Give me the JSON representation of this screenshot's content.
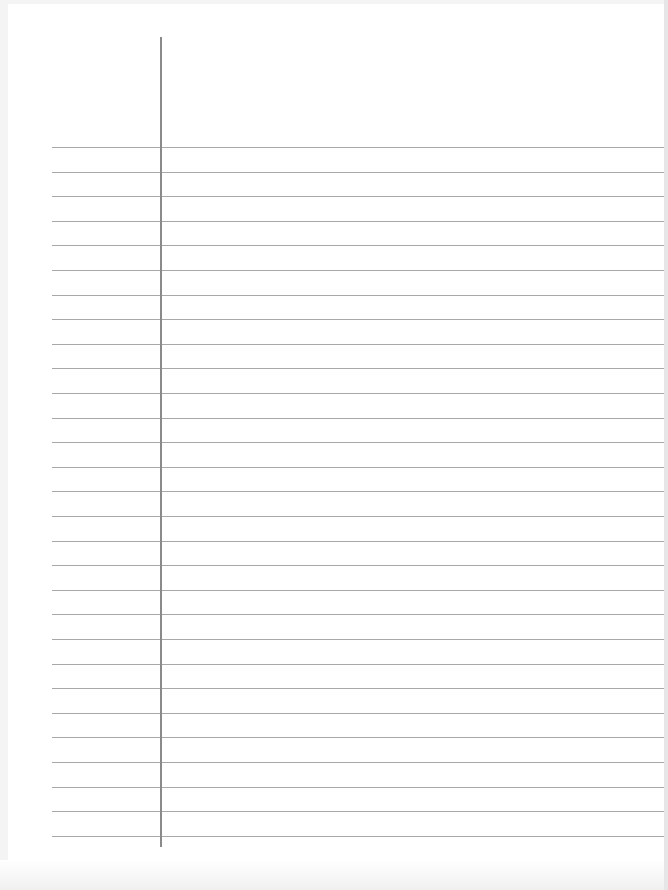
{
  "page": {
    "type": "lined-paper",
    "line_color": "#a8a8a8",
    "margin_line_color": "#8a8a8a",
    "paper_color": "#ffffff",
    "rule_count": 29,
    "first_rule_y": 147,
    "rule_spacing": 24.6
  }
}
